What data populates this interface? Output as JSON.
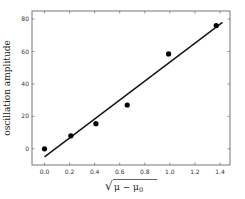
{
  "chart_data": {
    "type": "scatter",
    "title": "",
    "xlabel": "√(μ − μ0)",
    "xlabel_parts": {
      "sqrt": "√",
      "mu": "μ",
      "minus": " − ",
      "mu0": "μ",
      "sub": "0"
    },
    "ylabel": "oscillation amplitude",
    "xlim": [
      -0.1,
      1.48
    ],
    "ylim": [
      -10,
      85
    ],
    "xticks": [
      0.0,
      0.2,
      0.4,
      0.6,
      0.8,
      1.0,
      1.2,
      1.4
    ],
    "xtick_labels": [
      "0.0",
      "0.2",
      "0.4",
      "0.6",
      "0.8",
      "1.0",
      "1.2",
      "1.4"
    ],
    "yticks": [
      0,
      20,
      40,
      60,
      80
    ],
    "ytick_labels": [
      "0",
      "20",
      "40",
      "60",
      "80"
    ],
    "grid": false,
    "legend": null,
    "series": [
      {
        "name": "data",
        "type": "scatter",
        "x": [
          0.0,
          0.21,
          0.41,
          0.66,
          0.99,
          1.37
        ],
        "y": [
          0,
          8,
          15.5,
          27,
          58.5,
          76
        ],
        "color": "#000000"
      },
      {
        "name": "linear fit",
        "type": "line",
        "x": [
          0.0,
          1.42
        ],
        "y": [
          -5,
          78
        ],
        "color": "#111111"
      }
    ]
  }
}
